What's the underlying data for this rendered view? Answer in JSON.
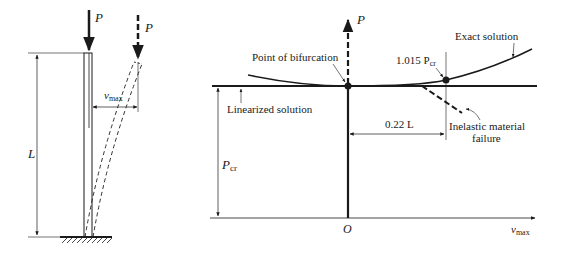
{
  "left_figure": {
    "load_label": "P",
    "deflected_load_label": "P",
    "length_label": "L",
    "deflection_label_main": "v",
    "deflection_label_sub": "max"
  },
  "right_figure": {
    "y_axis_label": "P",
    "x_axis_label_main": "v",
    "x_axis_label_sub": "max",
    "origin_label": "O",
    "pcr_label_main": "P",
    "pcr_label_sub": "cr",
    "annotations": {
      "bifurcation": "Point of bifurcation",
      "linearized": "Linearized solution",
      "exact": "Exact solution",
      "ratio_main": "1.015 P",
      "ratio_sub": "cr",
      "deflection": "0.22 L",
      "inelastic_line1": "Inelastic material",
      "inelastic_line2": "failure"
    }
  }
}
